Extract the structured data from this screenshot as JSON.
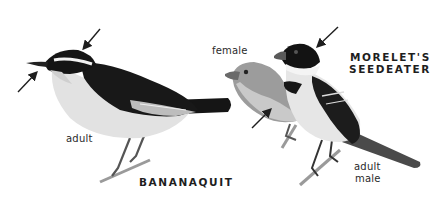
{
  "figure": {
    "species": [
      {
        "name": "BANANAQUIT",
        "labels": [
          "adult"
        ],
        "arrows": [
          "eyebrow-stripe-arrow",
          "bill-arrow"
        ]
      },
      {
        "name_line1": "MORELET'S",
        "name_line2": "SEEDEATER",
        "labels": [
          "female",
          "adult",
          "male"
        ],
        "arrows": [
          "black-cap-arrow",
          "female-flank-arrow"
        ]
      }
    ],
    "colors": {
      "background": "#ffffff",
      "ink": "#1e1e1e",
      "bird_dark": "#151515",
      "bird_mid": "#8a8a8a",
      "bird_light": "#e4e4e4"
    }
  }
}
